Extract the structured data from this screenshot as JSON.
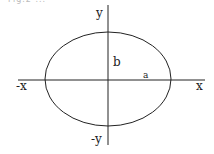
{
  "figure": {
    "type": "ellipse-diagram",
    "top_cut_text": "Fig.2 ...",
    "labels": {
      "y_pos": "y",
      "y_neg": "-y",
      "x_pos": "x",
      "x_neg": "-x",
      "semi_minor": "b",
      "semi_major": "a"
    },
    "colors": {
      "stroke": "#222222",
      "background": "#ffffff"
    }
  }
}
